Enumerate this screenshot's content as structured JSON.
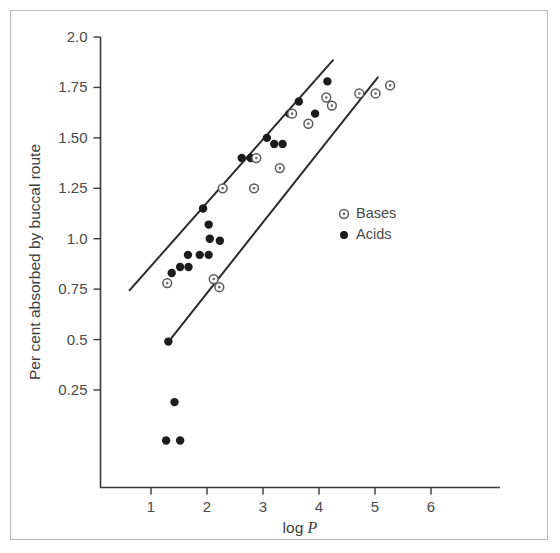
{
  "figure": {
    "background_color": "#ffffff",
    "frame_color": "#b9b9b9",
    "width": 560,
    "height": 553
  },
  "chart_data": {
    "type": "scatter",
    "title": "",
    "xlabel": "log P",
    "xlabel_plain": "log",
    "xlabel_italic": "P",
    "ylabel": "Per cent absorbed by buccal route",
    "xlim": [
      0.1,
      6.8
    ],
    "ylim": [
      0.0,
      2.0
    ],
    "xticks": [
      1,
      2,
      3,
      4,
      5,
      6
    ],
    "xtick_labels": [
      "1",
      "2",
      "3",
      "4",
      "5",
      "6"
    ],
    "yticks": [
      0.25,
      0.5,
      0.75,
      1.0,
      1.25,
      1.5,
      1.75,
      2.0
    ],
    "ytick_labels": [
      "0.25",
      "0.5",
      "0.75",
      "1.0",
      "1.25",
      "1.50",
      "1.75",
      "2.0"
    ],
    "grid": false,
    "legend_position": "center-right",
    "legend": [
      {
        "name": "Bases",
        "marker": "open-circle-dot",
        "color": "#6a6a6a"
      },
      {
        "name": "Acids",
        "marker": "filled-circle",
        "color": "#1c1c1c"
      }
    ],
    "series": [
      {
        "name": "Acids",
        "marker": "filled-circle",
        "color": "#1c1c1c",
        "points": [
          {
            "x": 1.27,
            "y": 0.0
          },
          {
            "x": 1.52,
            "y": 0.0
          },
          {
            "x": 1.42,
            "y": 0.19
          },
          {
            "x": 1.31,
            "y": 0.49
          },
          {
            "x": 1.37,
            "y": 0.83
          },
          {
            "x": 1.52,
            "y": 0.86
          },
          {
            "x": 1.67,
            "y": 0.86
          },
          {
            "x": 1.66,
            "y": 0.92
          },
          {
            "x": 1.87,
            "y": 0.92
          },
          {
            "x": 2.03,
            "y": 0.92
          },
          {
            "x": 2.05,
            "y": 1.0
          },
          {
            "x": 2.23,
            "y": 0.99
          },
          {
            "x": 2.03,
            "y": 1.07
          },
          {
            "x": 1.93,
            "y": 1.15
          },
          {
            "x": 2.62,
            "y": 1.4
          },
          {
            "x": 2.78,
            "y": 1.4
          },
          {
            "x": 3.07,
            "y": 1.5
          },
          {
            "x": 3.2,
            "y": 1.47
          },
          {
            "x": 3.35,
            "y": 1.47
          },
          {
            "x": 3.47,
            "y": 1.62
          },
          {
            "x": 3.64,
            "y": 1.68
          },
          {
            "x": 3.93,
            "y": 1.62
          },
          {
            "x": 4.15,
            "y": 1.78
          }
        ]
      },
      {
        "name": "Bases",
        "marker": "open-circle-dot",
        "color": "#6a6a6a",
        "points": [
          {
            "x": 1.29,
            "y": 0.78
          },
          {
            "x": 2.12,
            "y": 0.8
          },
          {
            "x": 2.22,
            "y": 0.76
          },
          {
            "x": 2.28,
            "y": 1.25
          },
          {
            "x": 2.84,
            "y": 1.25
          },
          {
            "x": 2.88,
            "y": 1.4
          },
          {
            "x": 3.3,
            "y": 1.35
          },
          {
            "x": 3.52,
            "y": 1.62
          },
          {
            "x": 3.81,
            "y": 1.57
          },
          {
            "x": 4.13,
            "y": 1.7
          },
          {
            "x": 4.23,
            "y": 1.66
          },
          {
            "x": 4.72,
            "y": 1.72
          },
          {
            "x": 5.01,
            "y": 1.72
          },
          {
            "x": 5.27,
            "y": 1.76
          }
        ]
      }
    ],
    "trend_lines": [
      {
        "name": "upper-boundary-line",
        "x1": 0.62,
        "y1": 0.745,
        "x2": 4.25,
        "y2": 1.885
      },
      {
        "name": "lower-boundary-line",
        "x1": 1.3,
        "y1": 0.485,
        "x2": 5.05,
        "y2": 1.8
      }
    ]
  }
}
